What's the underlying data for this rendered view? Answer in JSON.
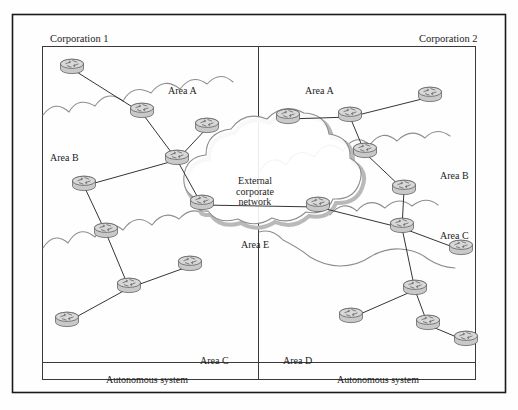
{
  "figure": {
    "background": "#fefefe",
    "line_color": "#2a2a2a",
    "cloud_color": "#8a8a8a",
    "router_fill": "#d8d8d8",
    "router_stroke": "#555555",
    "border_color": "#1a1a1a"
  },
  "outer_frame": {
    "label": "outer-border"
  },
  "corporations": [
    {
      "id": "corp1",
      "label": "Corporation 1",
      "x": 50,
      "y": 33
    },
    {
      "id": "corp2",
      "label": "Corporation 2",
      "x": 419,
      "y": 33
    }
  ],
  "autonomous_systems": [
    {
      "id": "as-left",
      "label": "Autonomous system",
      "cx": 147,
      "cy": 374
    },
    {
      "id": "as-right",
      "label": "Autonomous system",
      "cx": 378,
      "cy": 374
    }
  ],
  "area_labels": [
    {
      "id": "area-a-left",
      "label": "Area A",
      "x": 168,
      "y": 85
    },
    {
      "id": "area-b-left",
      "label": "Area B",
      "x": 50,
      "y": 152
    },
    {
      "id": "area-c-left",
      "label": "Area C",
      "x": 200,
      "y": 355
    },
    {
      "id": "area-a-right",
      "label": "Area A",
      "x": 305,
      "y": 85
    },
    {
      "id": "area-b-right",
      "label": "Area B",
      "x": 440,
      "y": 170
    },
    {
      "id": "area-c-right",
      "label": "Area C",
      "x": 440,
      "y": 230
    },
    {
      "id": "area-d-right",
      "label": "Area D",
      "x": 283,
      "y": 355
    }
  ],
  "external_cloud": {
    "title_lines": [
      "External",
      "corporate",
      "network"
    ],
    "title_x": 255,
    "title_y": 176,
    "area_label": "Area E",
    "area_x": 255,
    "area_y": 239
  },
  "routers": [
    {
      "id": "r1",
      "side": "left",
      "x": 72,
      "y": 69
    },
    {
      "id": "r2",
      "side": "left",
      "x": 142,
      "y": 113
    },
    {
      "id": "r3",
      "side": "left",
      "x": 207,
      "y": 128
    },
    {
      "id": "r4",
      "side": "left",
      "x": 177,
      "y": 160
    },
    {
      "id": "r5",
      "side": "left",
      "x": 84,
      "y": 186
    },
    {
      "id": "r6",
      "side": "left",
      "x": 106,
      "y": 233
    },
    {
      "id": "r7",
      "side": "left",
      "x": 129,
      "y": 288
    },
    {
      "id": "r8",
      "side": "left",
      "x": 190,
      "y": 266
    },
    {
      "id": "r9",
      "side": "left",
      "x": 67,
      "y": 322
    },
    {
      "id": "r10",
      "side": "left",
      "x": 202,
      "y": 205
    },
    {
      "id": "r11",
      "side": "right",
      "x": 288,
      "y": 119
    },
    {
      "id": "r12",
      "side": "right",
      "x": 350,
      "y": 117
    },
    {
      "id": "r13",
      "side": "right",
      "x": 430,
      "y": 97
    },
    {
      "id": "r14",
      "side": "right",
      "x": 365,
      "y": 153
    },
    {
      "id": "r15",
      "side": "right",
      "x": 404,
      "y": 190
    },
    {
      "id": "r16",
      "side": "right",
      "x": 318,
      "y": 207
    },
    {
      "id": "r17",
      "side": "right",
      "x": 402,
      "y": 228
    },
    {
      "id": "r18",
      "side": "right",
      "x": 461,
      "y": 250
    },
    {
      "id": "r19",
      "side": "right",
      "x": 415,
      "y": 290
    },
    {
      "id": "r20",
      "side": "right",
      "x": 351,
      "y": 318
    },
    {
      "id": "r21",
      "side": "right",
      "x": 428,
      "y": 325
    },
    {
      "id": "r22",
      "side": "right",
      "x": 466,
      "y": 341
    }
  ],
  "links": [
    {
      "from": "r1",
      "to": "r2"
    },
    {
      "from": "r2",
      "to": "r4"
    },
    {
      "from": "r4",
      "to": "r3"
    },
    {
      "from": "r4",
      "to": "r5"
    },
    {
      "from": "r4",
      "to": "r10"
    },
    {
      "from": "r5",
      "to": "r6"
    },
    {
      "from": "r6",
      "to": "r7"
    },
    {
      "from": "r7",
      "to": "r8"
    },
    {
      "from": "r7",
      "to": "r9"
    },
    {
      "from": "r10",
      "to": "r16"
    },
    {
      "from": "r11",
      "to": "r12"
    },
    {
      "from": "r12",
      "to": "r13"
    },
    {
      "from": "r12",
      "to": "r14"
    },
    {
      "from": "r14",
      "to": "r15"
    },
    {
      "from": "r15",
      "to": "r17"
    },
    {
      "from": "r16",
      "to": "r17"
    },
    {
      "from": "r17",
      "to": "r18"
    },
    {
      "from": "r17",
      "to": "r19"
    },
    {
      "from": "r19",
      "to": "r20"
    },
    {
      "from": "r19",
      "to": "r21"
    },
    {
      "from": "r21",
      "to": "r22"
    }
  ]
}
